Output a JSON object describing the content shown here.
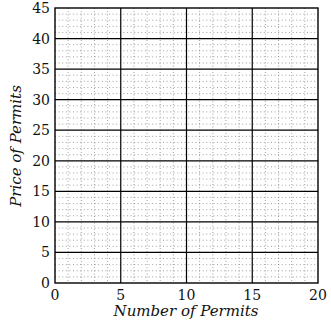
{
  "chart_data": {
    "type": "line",
    "title": "",
    "xlabel": "Number of Permits",
    "ylabel": "Price of Permits",
    "xlim": [
      0,
      20
    ],
    "ylim": [
      0,
      45
    ],
    "x_ticks": [
      0,
      5,
      10,
      15,
      20
    ],
    "y_ticks": [
      0,
      5,
      10,
      15,
      20,
      25,
      30,
      35,
      40,
      45
    ],
    "grid": {
      "major": true,
      "major_step_x": 5,
      "major_step_y": 5,
      "minor": true,
      "minor_step_x": 1,
      "minor_step_y": 1,
      "minor_style": "dotted"
    },
    "series": []
  },
  "labels": {
    "xlabel": "Number of Permits",
    "ylabel": "Price of Permits"
  }
}
